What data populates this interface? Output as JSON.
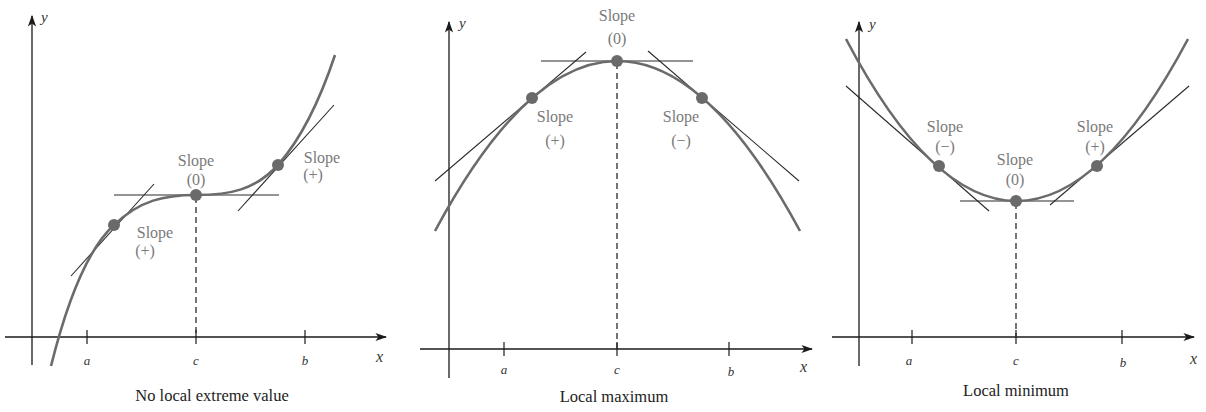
{
  "panels": [
    {
      "caption": "No local extreme value",
      "axis_x": "x",
      "axis_y": "y",
      "ticks": [
        "a",
        "c",
        "b"
      ],
      "points": [
        {
          "slope_word": "Slope",
          "sign": "(+)"
        },
        {
          "slope_word": "Slope",
          "sign": "(0)"
        },
        {
          "slope_word": "Slope",
          "sign": "(+)"
        }
      ]
    },
    {
      "caption": "Local maximum",
      "axis_x": "x",
      "axis_y": "y",
      "ticks": [
        "a",
        "c",
        "b"
      ],
      "points": [
        {
          "slope_word": "Slope",
          "sign": "(+)"
        },
        {
          "slope_word": "Slope",
          "sign": "(0)"
        },
        {
          "slope_word": "Slope",
          "sign": "(−)"
        }
      ]
    },
    {
      "caption": "Local minimum",
      "axis_x": "x",
      "axis_y": "y",
      "ticks": [
        "a",
        "c",
        "b"
      ],
      "points": [
        {
          "slope_word": "Slope",
          "sign": "(−)"
        },
        {
          "slope_word": "Slope",
          "sign": "(0)"
        },
        {
          "slope_word": "Slope",
          "sign": "(+)"
        }
      ]
    }
  ]
}
